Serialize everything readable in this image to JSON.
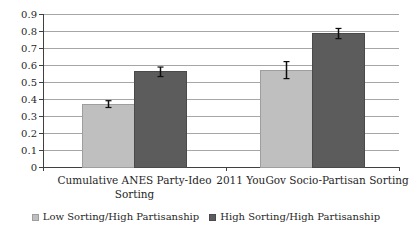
{
  "chart_data": {
    "type": "bar",
    "title": "",
    "xlabel": "",
    "ylabel": "",
    "categories": [
      {
        "label": "Cumulative ANES Party-Ideo Sorting",
        "lines": [
          "Cumulative ANES Party-Ideo",
          "Sorting"
        ]
      },
      {
        "label": "2011 YouGov Socio-Partisan Sorting",
        "lines": [
          "2011 YouGov Socio-Partisan Sorting"
        ]
      }
    ],
    "series": [
      {
        "name": "Low Sorting/High Partisanship",
        "values": [
          0.37,
          0.57
        ],
        "errors": [
          0.02,
          0.05
        ],
        "color": "#bfbfbf",
        "border": "#9e9e9e"
      },
      {
        "name": "High Sorting/High Partisanship",
        "values": [
          0.56,
          0.785
        ],
        "errors": [
          0.028,
          0.03
        ],
        "color": "#5c5c5c",
        "border": "#4a4a4a"
      }
    ],
    "ylim": [
      0,
      0.9
    ],
    "ytick_step": 0.1,
    "yticks": [
      "0",
      "0.1",
      "0.2",
      "0.3",
      "0.4",
      "0.5",
      "0.6",
      "0.7",
      "0.8",
      "0.9"
    ],
    "grid": true,
    "error_bars": true,
    "legend_position": "bottom",
    "colors": {
      "gridline": "#a6a6a6",
      "axis": "#404040",
      "text": "#1f1f1f",
      "error": "#0d0d0d",
      "background": "#ffffff"
    }
  }
}
